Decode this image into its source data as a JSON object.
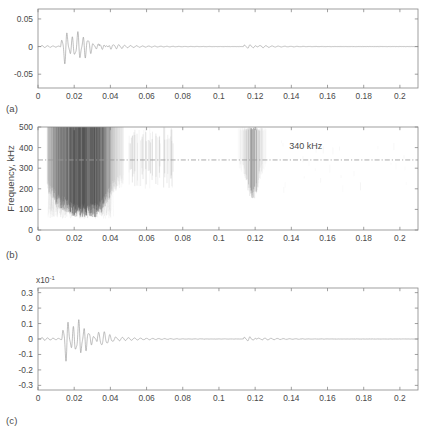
{
  "figure": {
    "panel_labels": {
      "a": "(a)",
      "b": "(b)",
      "c": "(c)"
    }
  },
  "chart_data": [
    {
      "id": "panel-a",
      "type": "line",
      "title": "",
      "xlabel": "",
      "ylabel": "",
      "xlim": [
        0,
        0.21
      ],
      "ylim": [
        -0.075,
        0.068
      ],
      "xticks": [
        0,
        0.02,
        0.04,
        0.06,
        0.08,
        0.1,
        0.12,
        0.14,
        0.16,
        0.18,
        0.2
      ],
      "xticklabels": [
        "0",
        "0.02",
        "0.04",
        "0.06",
        "0.08",
        "0.1",
        "0.12",
        "0.14",
        "0.16",
        "0.18",
        "0.2"
      ],
      "yticks": [
        0.05,
        0,
        -0.05
      ],
      "yticklabels": [
        "0.05",
        "0",
        "-0.05"
      ],
      "grid": false,
      "legend": "none",
      "series": [
        {
          "name": "acoustic emission signal",
          "description": "damped oscillatory burst starting near t=0.012 s with peak amplitude about 0.062, decaying to baseline by t=0.05 s, plus a small echo burst near t=0.115-0.125 s with amplitude about 0.008"
        }
      ],
      "events": [
        {
          "name": "main burst",
          "t_start": 0.012,
          "t_end": 0.05,
          "peak_amplitude": 0.062
        },
        {
          "name": "echo burst",
          "t_start": 0.113,
          "t_end": 0.128,
          "peak_amplitude": 0.008
        }
      ]
    },
    {
      "id": "panel-b",
      "type": "heatmap",
      "title": "",
      "xlabel": "",
      "ylabel": "Frequency, kHz",
      "xlim": [
        0,
        0.21
      ],
      "ylim": [
        0,
        500
      ],
      "xticks": [
        0,
        0.02,
        0.04,
        0.06,
        0.08,
        0.1,
        0.12,
        0.14,
        0.16,
        0.18,
        0.2
      ],
      "xticklabels": [
        "0",
        "0.02",
        "0.04",
        "0.06",
        "0.08",
        "0.1",
        "0.12",
        "0.14",
        "0.16",
        "0.18",
        "0.2"
      ],
      "yticks": [
        0,
        100,
        200,
        300,
        400,
        500
      ],
      "yticklabels": [
        "0",
        "100",
        "200",
        "300",
        "400",
        "500"
      ],
      "grid": false,
      "legend": "none",
      "annotations": [
        {
          "name": "reference-frequency-label",
          "text": "340 kHz",
          "x": 0.148,
          "y": 395
        }
      ],
      "reference_lines": [
        {
          "name": "340 kHz cutoff",
          "orientation": "horizontal",
          "value": 340,
          "style": "dash-dot"
        }
      ],
      "series": [
        {
          "name": "spectrogram energy",
          "description": "dense vertical striations of broadband energy from t=0.006 to 0.048 s covering 100-500 kHz, strongest between t=0.014 and 0.035 s; isolated narrow bursts near t=0.055-0.07 s; secondary echo cluster at t=0.113-0.127 s covering 150-500 kHz"
        }
      ]
    },
    {
      "id": "panel-c",
      "type": "line",
      "title": "",
      "xlabel": "",
      "ylabel": "",
      "y_exponent": "x10",
      "y_exponent_power": "-1",
      "xlim": [
        0,
        0.21
      ],
      "ylim": [
        -0.33,
        0.33
      ],
      "xticks": [
        0,
        0.02,
        0.04,
        0.06,
        0.08,
        0.1,
        0.12,
        0.14,
        0.16,
        0.18,
        0.2
      ],
      "xticklabels": [
        "0",
        "0.02",
        "0.04",
        "0.06",
        "0.08",
        "0.1",
        "0.12",
        "0.14",
        "0.16",
        "0.18",
        "0.2"
      ],
      "yticks": [
        0.3,
        0.2,
        0.1,
        0,
        -0.1,
        -0.2,
        -0.3
      ],
      "yticklabels": [
        "0.3",
        "0.2",
        "0.1",
        "0",
        "-0.1",
        "-0.2",
        "-0.3"
      ],
      "grid": false,
      "legend": "none",
      "series": [
        {
          "name": "filtered signal",
          "description": "damped oscillatory burst starting near t=0.013 s with peak amplitude about 0.29 (x10^-1), decaying by t=0.045 s, with a small echo burst near t=0.113-0.125 s of amplitude about 0.035 (x10^-1)"
        }
      ],
      "events": [
        {
          "name": "main burst",
          "t_start": 0.013,
          "t_end": 0.045,
          "peak_amplitude": 0.29
        },
        {
          "name": "echo burst",
          "t_start": 0.113,
          "t_end": 0.125,
          "peak_amplitude": 0.035
        }
      ]
    }
  ]
}
